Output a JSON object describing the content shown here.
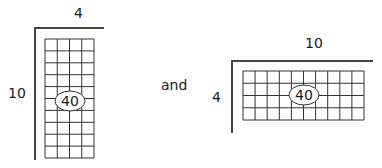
{
  "figures": [
    {
      "id": "tall",
      "top_label": "4",
      "side_label": "10",
      "center_label": "40",
      "cols": 4,
      "rows": 10,
      "frame": {
        "x": 35,
        "y": 28,
        "w": 69,
        "h": 132
      },
      "grid": {
        "x": 45,
        "y": 39,
        "w": 49,
        "h": 119
      },
      "ellipse": {
        "cx": 70,
        "cy": 101,
        "rx": 15,
        "ry": 10
      },
      "top_label_pos": {
        "x": 74,
        "y": 6
      },
      "side_label_pos": {
        "x": 8,
        "y": 86
      }
    },
    {
      "id": "wide",
      "top_label": "10",
      "side_label": "4",
      "center_label": "40",
      "cols": 10,
      "rows": 4,
      "frame": {
        "x": 232,
        "y": 61,
        "w": 141,
        "h": 72
      },
      "grid": {
        "x": 243,
        "y": 71,
        "w": 121,
        "h": 49
      },
      "ellipse": {
        "cx": 304,
        "cy": 95,
        "rx": 15,
        "ry": 10
      },
      "top_label_pos": {
        "x": 305,
        "y": 36
      },
      "side_label_pos": {
        "x": 212,
        "y": 90
      }
    }
  ],
  "connector_text": "and",
  "connector_pos": {
    "x": 161,
    "y": 78
  },
  "colors": {
    "line": "#333333",
    "frame": "#444444",
    "text": "#1a1a1a"
  }
}
